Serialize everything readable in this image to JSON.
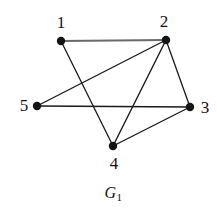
{
  "figure": {
    "caption_text": "G",
    "caption_subscript": "1",
    "background_color": "#ffffff",
    "vertex_color": "#141414",
    "edge_color": "#1a1a1a",
    "edge_color_light": "#6a6a6a",
    "label_color": "#111111",
    "width": 217,
    "height": 209
  },
  "graph": {
    "vertices": [
      {
        "id": "1",
        "label": "1",
        "x": 61,
        "y": 41,
        "label_x": 61,
        "label_y": 22,
        "name": "vertex-1"
      },
      {
        "id": "2",
        "label": "2",
        "x": 166,
        "y": 40,
        "label_x": 164,
        "label_y": 21,
        "name": "vertex-2"
      },
      {
        "id": "3",
        "label": "3",
        "x": 190,
        "y": 107,
        "label_x": 205,
        "label_y": 107,
        "name": "vertex-3"
      },
      {
        "id": "4",
        "label": "4",
        "x": 113,
        "y": 146,
        "label_x": 114,
        "label_y": 163,
        "name": "vertex-4"
      },
      {
        "id": "5",
        "label": "5",
        "x": 37,
        "y": 106,
        "label_x": 24,
        "label_y": 105,
        "name": "vertex-5"
      }
    ],
    "edges": [
      {
        "from": "1",
        "to": "2",
        "name": "edge-1-2",
        "color": "#6a6a6a",
        "width": 1.9
      },
      {
        "from": "1",
        "to": "4",
        "name": "edge-1-4",
        "color": "#1a1a1a",
        "width": 1.3
      },
      {
        "from": "2",
        "to": "5",
        "name": "edge-2-5",
        "color": "#1a1a1a",
        "width": 1.4
      },
      {
        "from": "2",
        "to": "4",
        "name": "edge-2-4",
        "color": "#1a1a1a",
        "width": 1.4
      },
      {
        "from": "2",
        "to": "3",
        "name": "edge-2-3",
        "color": "#1a1a1a",
        "width": 1.3
      },
      {
        "from": "5",
        "to": "3",
        "name": "edge-5-3",
        "color": "#1a1a1a",
        "width": 1.4
      },
      {
        "from": "4",
        "to": "3",
        "name": "edge-4-3",
        "color": "#1a1a1a",
        "width": 1.4
      }
    ],
    "vertex_radius": 4.2
  }
}
